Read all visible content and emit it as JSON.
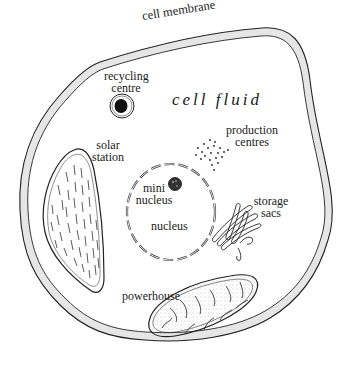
{
  "diagram": {
    "labels": {
      "cell_membrane": "cell membrane",
      "cell_fluid": "cell fluid",
      "recycling_centre_1": "recycling",
      "recycling_centre_2": "centre",
      "production_centres_1": "production",
      "production_centres_2": "centres",
      "solar_station_1": "solar",
      "solar_station_2": "station",
      "mini_nucleus_1": "mini",
      "mini_nucleus_2": "nucleus",
      "nucleus": "nucleus",
      "storage_sacs_1": "storage",
      "storage_sacs_2": "sacs",
      "powerhouse": "powerhouse"
    },
    "colors": {
      "ink": "#1a1a1a",
      "membrane_fill": "#e6e6e6",
      "background": "#ffffff"
    }
  }
}
